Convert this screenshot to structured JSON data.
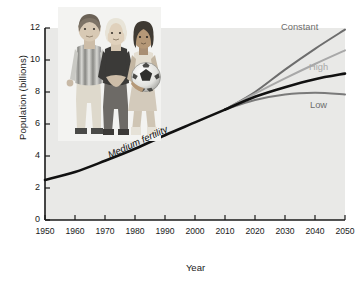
{
  "chart_data": {
    "type": "line",
    "title": "",
    "xlabel": "Year",
    "ylabel": "Population (billions)",
    "xlim": [
      1950,
      2050
    ],
    "ylim": [
      0,
      12
    ],
    "xticks": [
      1950,
      1960,
      1970,
      1980,
      1990,
      2000,
      2010,
      2020,
      2030,
      2040,
      2050
    ],
    "yticks": [
      0,
      2,
      4,
      6,
      8,
      10,
      12
    ],
    "grid": false,
    "legend_position": "inline-right-of-series",
    "annotations": [
      "Medium fertility"
    ],
    "series": [
      {
        "name": "Historical",
        "color": "#111111",
        "x": [
          1950,
          1960,
          1970,
          1980,
          1990,
          2000,
          2010
        ],
        "values": [
          2.5,
          3.0,
          3.7,
          4.45,
          5.3,
          6.1,
          6.9
        ]
      },
      {
        "name": "Constant",
        "color": "#6d6d6d",
        "x": [
          2010,
          2020,
          2030,
          2040,
          2050
        ],
        "values": [
          6.9,
          8.0,
          9.4,
          10.7,
          11.9
        ]
      },
      {
        "name": "High",
        "color": "#a8a8a8",
        "x": [
          2010,
          2020,
          2030,
          2040,
          2050
        ],
        "values": [
          6.9,
          7.9,
          8.85,
          9.75,
          10.6
        ]
      },
      {
        "name": "Medium fertility",
        "color": "#111111",
        "x": [
          2010,
          2020,
          2030,
          2040,
          2050
        ],
        "values": [
          6.9,
          7.7,
          8.3,
          8.8,
          9.15
        ]
      },
      {
        "name": "Low",
        "color": "#7a7a7a",
        "x": [
          2010,
          2020,
          2030,
          2040,
          2050
        ],
        "values": [
          6.9,
          7.5,
          7.85,
          7.95,
          7.85
        ]
      }
    ]
  },
  "labels": {
    "constant": "Constant",
    "high": "High",
    "low": "Low",
    "medium": "Medium fertility"
  },
  "axes": {
    "x_title": "Year",
    "y_title": "Population (billions)",
    "x_tick_labels": [
      "1950",
      "1960",
      "1970",
      "1980",
      "1990",
      "2000",
      "2010",
      "2020",
      "2030",
      "2040",
      "2050"
    ],
    "y_tick_labels": [
      "0",
      "2",
      "4",
      "6",
      "8",
      "10",
      "12"
    ]
  },
  "photo": {
    "alt": "photo-three-children-with-soccer-ball"
  },
  "colors": {
    "plot_background": "#e9e9e7",
    "axis": "#1a1a1a",
    "constant": "#6d6d6d",
    "high": "#a8a8a8",
    "medium": "#111111",
    "low": "#7a7a7a"
  }
}
